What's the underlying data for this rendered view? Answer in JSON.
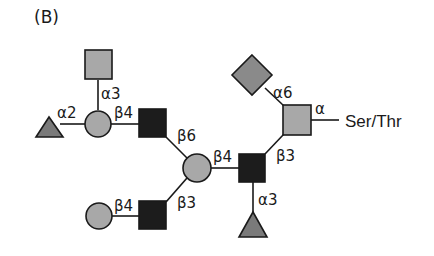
{
  "panel_label": "(B)",
  "colors": {
    "galactose_circle": "#a8a8a8",
    "glcnac_square": "#1c1c1c",
    "galnac_square": "#a8a8a8",
    "fucose_triangle": "#7a7a7a",
    "sialic_diamond": "#8a8a8a",
    "stroke": "#1a1a1a"
  },
  "nodes": [
    {
      "id": "galnac-top",
      "shape": "square",
      "fill": "light-gray"
    },
    {
      "id": "fuc-left",
      "shape": "triangle",
      "fill": "dark-gray"
    },
    {
      "id": "gal-upper",
      "shape": "circle",
      "fill": "light-gray"
    },
    {
      "id": "glcnac-upper",
      "shape": "square",
      "fill": "black"
    },
    {
      "id": "gal-center",
      "shape": "circle",
      "fill": "light-gray"
    },
    {
      "id": "gal-lower",
      "shape": "circle",
      "fill": "light-gray"
    },
    {
      "id": "glcnac-lower",
      "shape": "square",
      "fill": "black"
    },
    {
      "id": "glcnac-core",
      "shape": "square",
      "fill": "black"
    },
    {
      "id": "fuc-bottom",
      "shape": "triangle",
      "fill": "dark-gray"
    },
    {
      "id": "neu-diamond",
      "shape": "diamond",
      "fill": "gray"
    },
    {
      "id": "galnac-root",
      "shape": "square",
      "fill": "light-gray"
    }
  ],
  "linkages": {
    "galnac_top_to_gal": "α3",
    "fuc_to_gal": "α2",
    "gal_to_glcnac_upper": "β4",
    "glcnac_upper_to_center": "β6",
    "gal_lower_to_glcnac_lower": "β4",
    "glcnac_lower_to_center": "β3",
    "center_to_core": "β4",
    "core_to_root": "β3",
    "fuc_to_core": "α3",
    "diamond_to_root": "α6",
    "root_to_aglycone": "α"
  },
  "aglycone": "Ser/Thr"
}
